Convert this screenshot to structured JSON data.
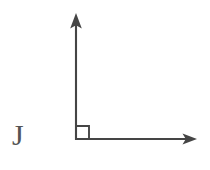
{
  "figure": {
    "kind": "geometry-diagram",
    "background_color": "#ffffff",
    "ink_color": "#3a3a3a",
    "label_color": "#4a4a4a",
    "canvas": {
      "width": 210,
      "height": 170
    }
  },
  "labels": {
    "left_glyph": "J"
  },
  "elements": {
    "vertical_axis": {
      "name": "vertical-axis",
      "label": "vertical ray with arrowhead",
      "from": {
        "x": 76,
        "y": 140
      },
      "to": {
        "x": 76,
        "y": 14
      },
      "arrowhead": "up",
      "stroke_width": 2.1
    },
    "horizontal_axis": {
      "name": "horizontal-axis",
      "label": "horizontal ray with arrowhead",
      "from": {
        "x": 75,
        "y": 139
      },
      "to": {
        "x": 196,
        "y": 139
      },
      "arrowhead": "right",
      "stroke_width": 2.1
    },
    "right_angle_marker": {
      "name": "right-angle-marker",
      "label": "square right-angle mark at origin",
      "origin": {
        "x": 76,
        "y": 139
      },
      "size": 13,
      "angle_degrees": 90
    },
    "origin_vertex": {
      "name": "origin-vertex",
      "label": "vertex where the two rays meet",
      "x": 76,
      "y": 139
    }
  }
}
